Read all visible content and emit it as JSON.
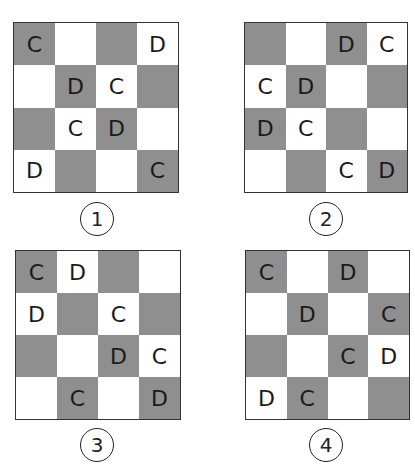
{
  "heading_fragment": "",
  "colors": {
    "dark_cell": "#8f8f8f",
    "light_cell": "#ffffff",
    "border": "#333333"
  },
  "options": [
    {
      "label": "1",
      "pattern": [
        [
          "dark",
          "light",
          "dark",
          "light"
        ],
        [
          "light",
          "dark",
          "light",
          "dark"
        ],
        [
          "dark",
          "light",
          "dark",
          "light"
        ],
        [
          "light",
          "dark",
          "light",
          "dark"
        ]
      ],
      "letters": [
        [
          "C",
          "",
          "",
          "D"
        ],
        [
          "",
          "D",
          "C",
          ""
        ],
        [
          "",
          "C",
          "D",
          ""
        ],
        [
          "D",
          "",
          "",
          "C"
        ]
      ]
    },
    {
      "label": "2",
      "pattern": [
        [
          "dark",
          "light",
          "dark",
          "light"
        ],
        [
          "light",
          "dark",
          "light",
          "dark"
        ],
        [
          "dark",
          "light",
          "dark",
          "light"
        ],
        [
          "light",
          "dark",
          "light",
          "dark"
        ]
      ],
      "letters": [
        [
          "",
          "",
          "D",
          "C"
        ],
        [
          "C",
          "D",
          "",
          ""
        ],
        [
          "D",
          "C",
          "",
          ""
        ],
        [
          "",
          "",
          "C",
          "D"
        ]
      ]
    },
    {
      "label": "3",
      "pattern": [
        [
          "dark",
          "light",
          "dark",
          "light"
        ],
        [
          "light",
          "dark",
          "light",
          "dark"
        ],
        [
          "dark",
          "light",
          "dark",
          "light"
        ],
        [
          "light",
          "dark",
          "light",
          "dark"
        ]
      ],
      "letters": [
        [
          "C",
          "D",
          "",
          ""
        ],
        [
          "D",
          "",
          "C",
          ""
        ],
        [
          "",
          "",
          "D",
          "C"
        ],
        [
          "",
          "C",
          "",
          "D"
        ]
      ]
    },
    {
      "label": "4",
      "pattern": [
        [
          "dark",
          "light",
          "dark",
          "light"
        ],
        [
          "light",
          "dark",
          "light",
          "dark"
        ],
        [
          "dark",
          "light",
          "dark",
          "light"
        ],
        [
          "light",
          "dark",
          "light",
          "dark"
        ]
      ],
      "letters": [
        [
          "C",
          "",
          "D",
          ""
        ],
        [
          "",
          "D",
          "",
          "C"
        ],
        [
          "",
          "",
          "C",
          "D"
        ],
        [
          "D",
          "C",
          "",
          ""
        ]
      ]
    }
  ]
}
